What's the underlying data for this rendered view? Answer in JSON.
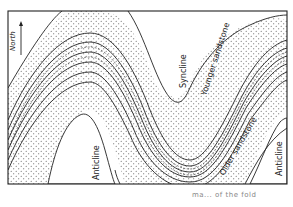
{
  "diagram": {
    "type": "geologic-fold-map",
    "compass": {
      "label": "North",
      "direction": "up"
    },
    "labels": {
      "syncline": "Syncline",
      "anticline_left": "Anticline",
      "anticline_right": "Anticline",
      "younger_sandstone": "Younger sandstone",
      "older_sandstone": "Older sandstone"
    },
    "caption": "ma... of the fold",
    "colors": {
      "line": "#222222",
      "background": "#ffffff",
      "stipple": "#555555"
    }
  }
}
